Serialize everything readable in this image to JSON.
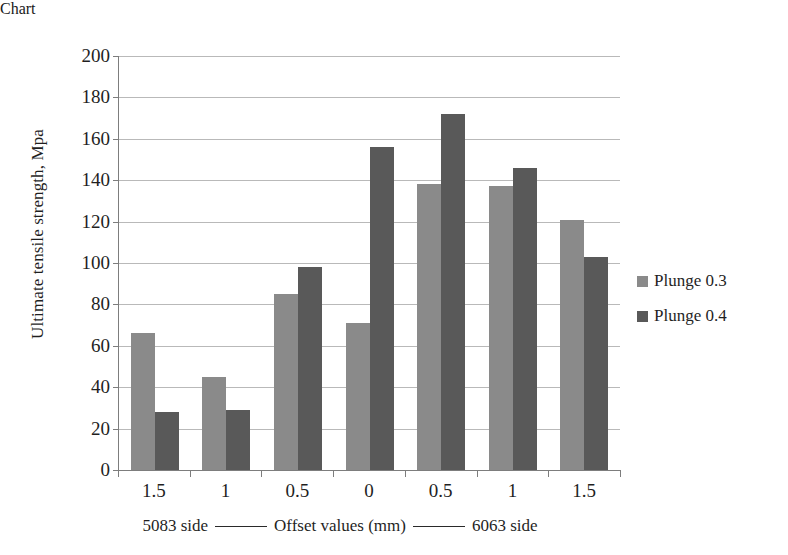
{
  "chart_data": {
    "type": "bar",
    "title": "",
    "categories": [
      "1.5",
      "1",
      "0.5",
      "0",
      "0.5",
      "1",
      "1.5"
    ],
    "series": [
      {
        "name": "Plunge 0.3",
        "color": "#8a8a8a",
        "values": [
          66,
          45,
          85,
          71,
          138,
          137,
          121
        ]
      },
      {
        "name": "Plunge 0.4",
        "color": "#595959",
        "values": [
          28,
          29,
          98,
          156,
          172,
          146,
          103
        ]
      }
    ],
    "xlabel": "Offset values (mm)",
    "ylabel": "Ultimate tensile strength, Mpa",
    "ylim": [
      0,
      200
    ],
    "ytick_step": 20,
    "yticks": [
      "200",
      "180",
      "160",
      "140",
      "120",
      "100",
      "80",
      "60",
      "40",
      "20",
      "0"
    ],
    "grid": true,
    "legend_position": "right",
    "axis_caption": {
      "left_text": "5083 side",
      "center_text": "Offset values (mm)",
      "right_text": "6063 side"
    }
  }
}
